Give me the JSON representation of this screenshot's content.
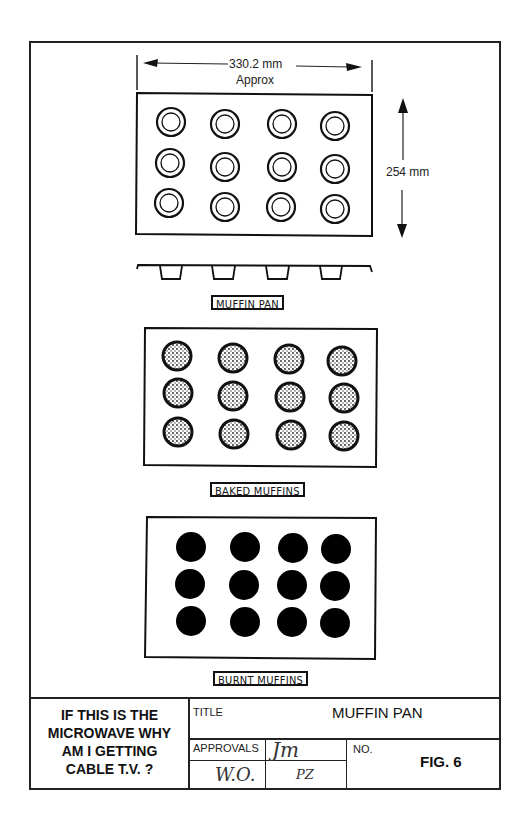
{
  "figure": {
    "dimensions": {
      "width_label": "330.2 mm",
      "width_sublabel": "Approx",
      "height_label": "254 mm"
    },
    "panels": [
      {
        "id": "muffin-pan",
        "label": "MUFFIN PAN",
        "rows": 3,
        "cols": 4,
        "cup_style": "empty-ring"
      },
      {
        "id": "baked-muffins",
        "label": "BAKED MUFFINS",
        "rows": 3,
        "cols": 4,
        "cup_style": "textured"
      },
      {
        "id": "burnt-muffins",
        "label": "BURNT MUFFINS",
        "rows": 3,
        "cols": 4,
        "cup_style": "solid-black"
      }
    ],
    "colors": {
      "line": "#111111",
      "background": "#ffffff",
      "burnt": "#000000"
    }
  },
  "title_block": {
    "joke": [
      "IF THIS IS THE",
      "MICROWAVE WHY",
      "AM I GETTING",
      "CABLE T.V. ?"
    ],
    "title_label": "TITLE",
    "title_value": "MUFFIN PAN",
    "approvals_label": "APPROVALS",
    "approvals_signatures": [
      "Jm",
      "W.O.",
      "PZ"
    ],
    "no_label": "NO.",
    "no_value": "FIG. 6"
  }
}
